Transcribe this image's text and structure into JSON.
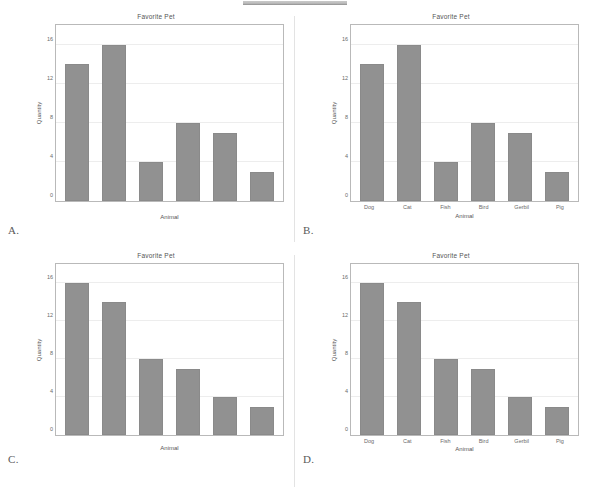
{
  "top_bar": {
    "name": "redaction-bar",
    "color": "#bdbdbd"
  },
  "figure_style": {
    "bar_color": "#919191",
    "bar_edge_color": "#8a8a8a",
    "grid_color": "#ededed",
    "frame_color": "#b9b9b9",
    "background": "#ffffff"
  },
  "panels": [
    {
      "letter": "A.",
      "show_xticks": false,
      "chart_data": {
        "type": "bar",
        "title": "Favorite Pet",
        "xlabel": "Animal",
        "ylabel": "Quantity",
        "categories": [
          "Dog",
          "Cat",
          "Fish",
          "Bird",
          "Gerbil",
          "Pig"
        ],
        "values": [
          14,
          16,
          4,
          8,
          7,
          3
        ],
        "yticks": [
          0,
          4,
          8,
          12,
          16
        ],
        "ylim": [
          0,
          18
        ],
        "grid": true,
        "legend": "none"
      }
    },
    {
      "letter": "B.",
      "show_xticks": true,
      "chart_data": {
        "type": "bar",
        "title": "Favorite Pet",
        "xlabel": "Animal",
        "ylabel": "Quantity",
        "categories": [
          "Dog",
          "Cat",
          "Fish",
          "Bird",
          "Gerbil",
          "Pig"
        ],
        "values": [
          14,
          16,
          4,
          8,
          7,
          3
        ],
        "yticks": [
          0,
          4,
          8,
          12,
          16
        ],
        "ylim": [
          0,
          18
        ],
        "grid": true,
        "legend": "none"
      }
    },
    {
      "letter": "C.",
      "show_xticks": false,
      "chart_data": {
        "type": "bar",
        "title": "Favorite Pet",
        "xlabel": "Animal",
        "ylabel": "Quantity",
        "categories": [
          "Dog",
          "Cat",
          "Fish",
          "Bird",
          "Gerbil",
          "Pig"
        ],
        "values": [
          16,
          14,
          8,
          7,
          4,
          3
        ],
        "yticks": [
          0,
          4,
          8,
          12,
          16
        ],
        "ylim": [
          0,
          18
        ],
        "grid": true,
        "legend": "none"
      }
    },
    {
      "letter": "D.",
      "show_xticks": true,
      "chart_data": {
        "type": "bar",
        "title": "Favorite Pet",
        "xlabel": "Animal",
        "ylabel": "Quantity",
        "categories": [
          "Dog",
          "Cat",
          "Fish",
          "Bird",
          "Gerbil",
          "Pig"
        ],
        "values": [
          16,
          14,
          8,
          7,
          4,
          3
        ],
        "yticks": [
          0,
          4,
          8,
          12,
          16
        ],
        "ylim": [
          0,
          18
        ],
        "grid": true,
        "legend": "none"
      }
    }
  ]
}
